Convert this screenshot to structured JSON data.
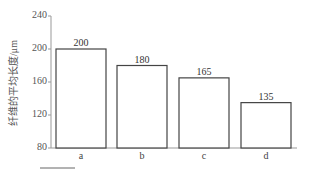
{
  "chart_data": {
    "type": "bar",
    "title": "",
    "xlabel": "",
    "ylabel": "纤维的平均长度/μm",
    "categories": [
      "a",
      "b",
      "c",
      "d"
    ],
    "values": [
      200,
      180,
      165,
      135
    ],
    "value_labels": [
      "200",
      "180",
      "165",
      "135"
    ],
    "ylim": [
      80,
      240
    ],
    "yticks": [
      80,
      120,
      160,
      200,
      240
    ],
    "ytick_labels": [
      "80",
      "120",
      "160",
      "200",
      "240"
    ],
    "grid": false,
    "legend": null,
    "bar_fill": "#ffffff",
    "bar_stroke": "#444444"
  }
}
